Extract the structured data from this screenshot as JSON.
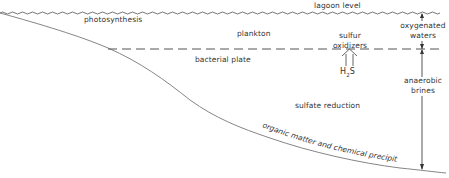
{
  "diagram": {
    "labels": {
      "lagoon_level": "lagoon level",
      "photosynthesis": "photosynthesis",
      "plankton": "plankton",
      "sulfur_oxidizers_line1": "sulfur",
      "sulfur_oxidizers_line2": "oxidizers",
      "h2s_h": "H",
      "h2s_sub": "2",
      "h2s_s": "S",
      "bacterial_plate": "bacterial plate",
      "oxygenated_waters_line1": "oxygenated",
      "oxygenated_waters_line2": "waters",
      "anaerobic_brines_line1": "anaerobic",
      "anaerobic_brines_line2": "brines",
      "sulfate_reduction": "sulfate reduction",
      "bottom_deposits": "organic matter and chemical precipitates"
    },
    "colors": {
      "line": "#555555",
      "text": "#333333",
      "background": "#ffffff"
    }
  }
}
